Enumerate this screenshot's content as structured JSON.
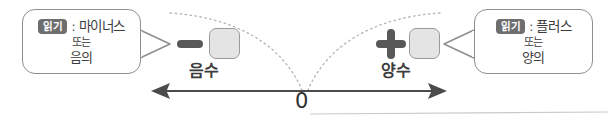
{
  "diagram": {
    "title_hidden": "",
    "zero_label": "0",
    "negative": {
      "axis_label": "음수",
      "sign_icon": "minus-sign",
      "box_value": "",
      "callout": {
        "badge": "읽기",
        "separator": ":",
        "line1": "마이너스",
        "line2": "또는",
        "line3": "음의"
      }
    },
    "positive": {
      "axis_label": "양수",
      "sign_icon": "plus-sign",
      "box_value": "",
      "callout": {
        "badge": "읽기",
        "separator": ":",
        "line1": "플러스",
        "line2": "또는",
        "line3": "양의"
      }
    }
  },
  "colors": {
    "badge_bg": "#6e6e6e",
    "badge_text": "#ffffff",
    "sign_fill": "#585858",
    "box_fill": "#e4e4e4",
    "box_border": "#9a9a9a",
    "callout_border": "#8f8f8f",
    "axis_line": "#4b4b4b",
    "dotted_curve": "#b4b4b4",
    "text": "#3d3d3d",
    "bottom_rule": "#c9c9c9",
    "background": "#ffffff"
  }
}
